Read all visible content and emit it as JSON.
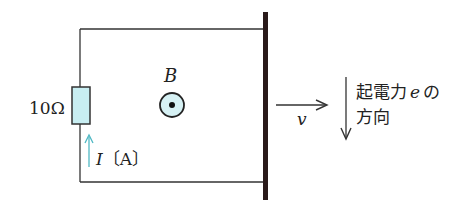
{
  "diagram": {
    "type": "circuit",
    "colors": {
      "wire": "#333333",
      "rod": "#2a1a1a",
      "resistor_fill": "#c8eef2",
      "current_arrow": "#4fb8c4",
      "b_field_fill": "#d6f1f4",
      "text": "#222222"
    },
    "resistor": {
      "label": "10Ω"
    },
    "current": {
      "symbol": "I",
      "unit": "〔A〕"
    },
    "magnetic_field": {
      "symbol": "B",
      "direction": "out-of-page"
    },
    "velocity": {
      "symbol": "v",
      "direction": "right"
    },
    "emf": {
      "line1_prefix": "起電力",
      "symbol": "e",
      "line1_suffix": "の",
      "line2": "方向",
      "direction": "down"
    }
  }
}
